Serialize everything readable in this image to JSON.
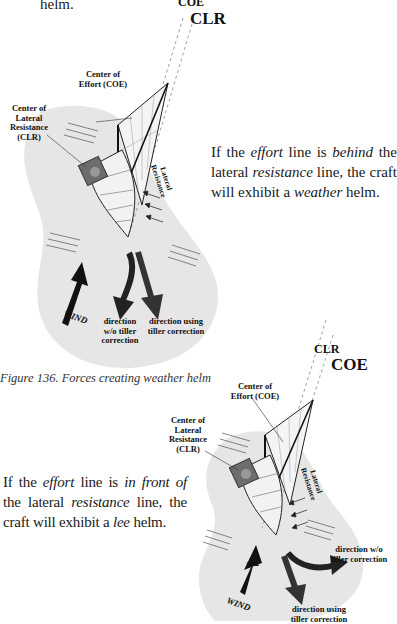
{
  "top_fragment": "helm.",
  "figure1": {
    "line_label_top": "COE",
    "line_label_bottom": "CLR",
    "coe_label": [
      "Center of",
      "Effort (COE)"
    ],
    "clr_label": [
      "Center of",
      "Lateral",
      "Resistance",
      "(CLR)"
    ],
    "lateral_resistance": [
      "Lateral",
      "Resistance"
    ],
    "wind": "WIND",
    "dir_without": [
      "direction",
      "w/o tiller",
      "correction"
    ],
    "dir_with": [
      "direction using",
      "tiller correction"
    ],
    "caption": "Figure 136.  Forces creating weather helm"
  },
  "paragraph1": {
    "p1": "If the ",
    "e1": "effort",
    "p2": " line is ",
    "e2": "behind",
    "p3": " the lateral ",
    "e3": "resistance",
    "p4": " line, the craft will exhibit a ",
    "e4": "weather",
    "p5": " helm."
  },
  "figure2": {
    "line_label_top": "CLR",
    "line_label_bottom": "COE",
    "coe_label": [
      "Center of",
      "Effort (COE)"
    ],
    "clr_label": [
      "Center of",
      "Lateral",
      "Resistance",
      "(CLR)"
    ],
    "lateral_resistance": [
      "Lateral",
      "Resistance"
    ],
    "wind": "WIND",
    "dir_without": [
      "direction w/o",
      "tiller correction"
    ],
    "dir_with": [
      "direction using",
      "tiller correction"
    ]
  },
  "paragraph2": {
    "p1": "If the ",
    "e1": "effort",
    "p2": " line is ",
    "e2": "in front of",
    "p3": " the lateral ",
    "e3": "resistance",
    "p4": " line, the craft will exhibit a ",
    "e4": "lee",
    "p5": " helm."
  }
}
